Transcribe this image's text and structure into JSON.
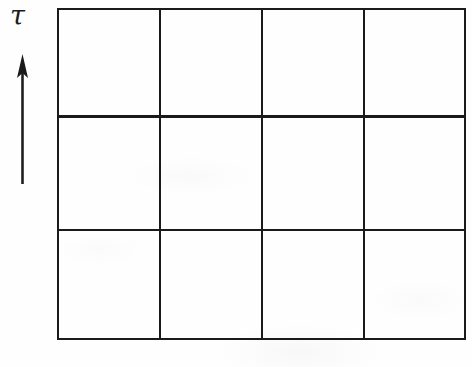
{
  "figure": {
    "background_color": "#fefefe",
    "ink_color": "#1a1a1a"
  },
  "axis": {
    "label": "τ",
    "label_name": "tau",
    "direction": "up",
    "arrow_icon": "arrow-up-icon"
  },
  "grid": {
    "columns": 4,
    "rows": 3,
    "left": 57,
    "top": 8,
    "right": 466,
    "bottom": 340,
    "line_color": "#1a1a1a",
    "line_width": 2.4,
    "column_edges": [
      57,
      160,
      262,
      364,
      466
    ],
    "row_edges": [
      8,
      116,
      230,
      340
    ],
    "cells": [
      [
        {
          "label": ""
        },
        {
          "label": ""
        },
        {
          "label": ""
        },
        {
          "label": ""
        }
      ],
      [
        {
          "label": ""
        },
        {
          "label": ""
        },
        {
          "label": ""
        },
        {
          "label": ""
        }
      ],
      [
        {
          "label": ""
        },
        {
          "label": ""
        },
        {
          "label": ""
        },
        {
          "label": ""
        }
      ]
    ]
  }
}
